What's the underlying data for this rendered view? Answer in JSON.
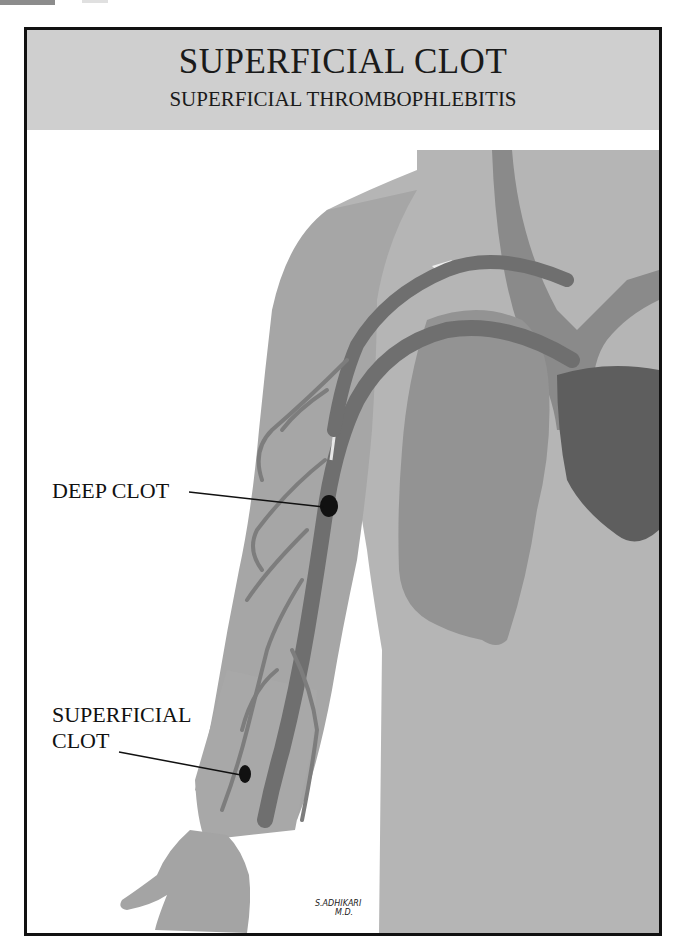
{
  "header": {
    "title": "SUPERFICIAL CLOT",
    "subtitle": "SUPERFICIAL THROMBOPHLEBITIS"
  },
  "labels": {
    "deep_clot": "DEEP CLOT",
    "superficial_clot_line1": "SUPERFICIAL",
    "superficial_clot_line2": "CLOT"
  },
  "signature": {
    "name": "S.ADHIKARI",
    "credential": "M.D."
  },
  "colors": {
    "header_bg": "#cfcfcf",
    "skin": "#a9a9a9",
    "vein": "#7a7a7a",
    "lung": "#8e8e8e",
    "heart": "#5e5e5e",
    "clot": "#111111",
    "border": "#111111"
  }
}
